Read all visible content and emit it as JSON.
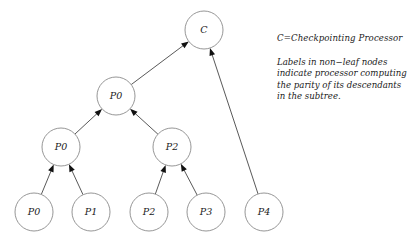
{
  "figure": {
    "background_color": "#ffffff",
    "node_stroke_color": "#8a8a8a",
    "edge_color": "#3a3a3a",
    "text_color": "#1a1a1a"
  },
  "nodes": [
    {
      "id": "c",
      "label": "C",
      "cx": 204,
      "cy": 30,
      "r": 19,
      "level": "root",
      "kind": "non-leaf"
    },
    {
      "id": "mid-p0",
      "label": "P0",
      "cx": 116,
      "cy": 96,
      "r": 19,
      "level": "inner1",
      "kind": "non-leaf"
    },
    {
      "id": "l-p0",
      "label": "P0",
      "cx": 61,
      "cy": 147,
      "r": 19,
      "level": "inner2",
      "kind": "non-leaf"
    },
    {
      "id": "l-p2",
      "label": "P2",
      "cx": 172,
      "cy": 147,
      "r": 19,
      "level": "inner2",
      "kind": "non-leaf"
    },
    {
      "id": "leaf-p0",
      "label": "P0",
      "cx": 34,
      "cy": 212,
      "r": 19,
      "level": "leaf",
      "kind": "leaf"
    },
    {
      "id": "leaf-p1",
      "label": "P1",
      "cx": 91,
      "cy": 212,
      "r": 19,
      "level": "leaf",
      "kind": "leaf"
    },
    {
      "id": "leaf-p2",
      "label": "P2",
      "cx": 149,
      "cy": 212,
      "r": 19,
      "level": "leaf",
      "kind": "leaf"
    },
    {
      "id": "leaf-p3",
      "label": "P3",
      "cx": 206,
      "cy": 212,
      "r": 19,
      "level": "leaf",
      "kind": "leaf"
    },
    {
      "id": "leaf-p4",
      "label": "P4",
      "cx": 264,
      "cy": 212,
      "r": 19,
      "level": "leaf",
      "kind": "leaf"
    }
  ],
  "edges": [
    {
      "id": "e-leafp0-lp0",
      "from": "leaf-p0",
      "to": "l-p0",
      "arrow": true
    },
    {
      "id": "e-leafp1-lp0",
      "from": "leaf-p1",
      "to": "l-p0",
      "arrow": true
    },
    {
      "id": "e-leafp2-lp2",
      "from": "leaf-p2",
      "to": "l-p2",
      "arrow": true
    },
    {
      "id": "e-leafp3-lp2",
      "from": "leaf-p3",
      "to": "l-p2",
      "arrow": true
    },
    {
      "id": "e-lp0-midp0",
      "from": "l-p0",
      "to": "mid-p0",
      "arrow": true
    },
    {
      "id": "e-lp2-midp0",
      "from": "l-p2",
      "to": "mid-p0",
      "arrow": true
    },
    {
      "id": "e-midp0-c",
      "from": "mid-p0",
      "to": "c",
      "arrow": true
    },
    {
      "id": "e-leafp4-c",
      "from": "leaf-p4",
      "to": "c",
      "arrow": true
    }
  ],
  "legend": {
    "title": "C=Checkpointing Processor",
    "note_lines": [
      "Labels in non−leaf nodes",
      "indicate processor computing",
      "the parity of its descendants",
      "in the subtree."
    ]
  }
}
